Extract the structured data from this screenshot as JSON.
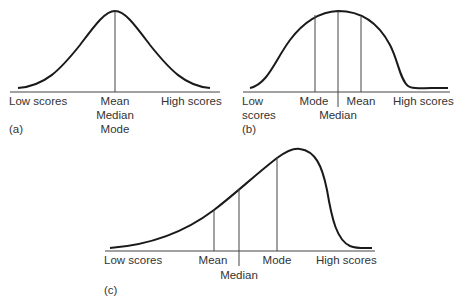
{
  "panels": {
    "a": {
      "tag": "(a)",
      "low": "Low scores",
      "high": "High scores",
      "center": [
        "Mean",
        "Median",
        "Mode"
      ]
    },
    "b": {
      "tag": "(b)",
      "low1": "Low",
      "low2": "scores",
      "mode": "Mode",
      "median": "Median",
      "mean": "Mean",
      "high": "High scores"
    },
    "c": {
      "tag": "(c)",
      "low": "Low scores",
      "mean": "Mean",
      "median": "Median",
      "mode": "Mode",
      "high": "High scores"
    }
  },
  "colors": {
    "line": "#1a1a1a",
    "text": "#333333",
    "background": "#ffffff"
  }
}
